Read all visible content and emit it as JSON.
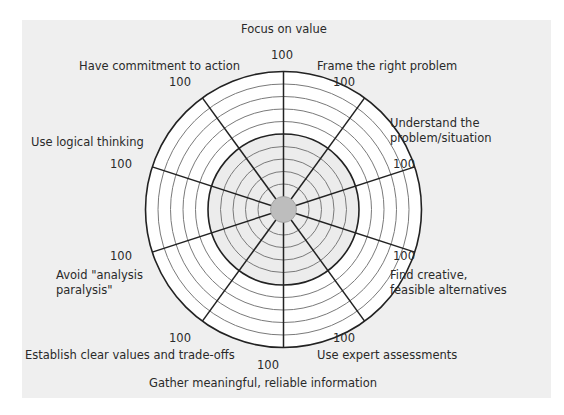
{
  "diagram": {
    "type": "decision-quality-wheel",
    "scale_max": "100",
    "ring_count": 10,
    "emphasized_ring": 5,
    "colors": {
      "panel_bg": "#efefef",
      "outer_band": "#ffffff",
      "inner_band": "#ececec",
      "center_disc": "#bdbdbd",
      "spoke": "#222222",
      "ring": "#7a7a7a"
    },
    "spokes": [
      {
        "label": "Focus on value",
        "value_label": "100"
      },
      {
        "label": "Frame the right problem",
        "value_label": "100"
      },
      {
        "label": "Understand the problem/situation",
        "value_label": "100"
      },
      {
        "label": "Find creative, feasible alternatives",
        "value_label": "100"
      },
      {
        "label": "Use expert assessments",
        "value_label": "100"
      },
      {
        "label": "Gather meaningful, reliable information",
        "value_label": "100"
      },
      {
        "label": "Establish clear values and trade-offs",
        "value_label": "100"
      },
      {
        "label": "Avoid \"analysis paralysis\"",
        "value_label": "100"
      },
      {
        "label": "Use logical thinking",
        "value_label": "100"
      },
      {
        "label": "Have commitment to action",
        "value_label": "100"
      }
    ],
    "label_lines": {
      "understand_1": "Understand the",
      "understand_2": "problem/situation",
      "find_1": "Find creative,",
      "find_2": "feasible alternatives",
      "avoid_1": "Avoid \"analysis",
      "avoid_2": "paralysis\""
    }
  }
}
